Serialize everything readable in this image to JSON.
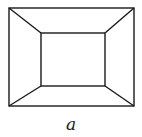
{
  "diagram": {
    "label": "a",
    "stroke_color": "#1a1a1a",
    "outer_rect": {
      "x1": 9,
      "y1": 8,
      "x2": 134,
      "y2": 106
    },
    "inner_rect": {
      "x1": 41,
      "y1": 33,
      "x2": 105,
      "y2": 86
    }
  }
}
